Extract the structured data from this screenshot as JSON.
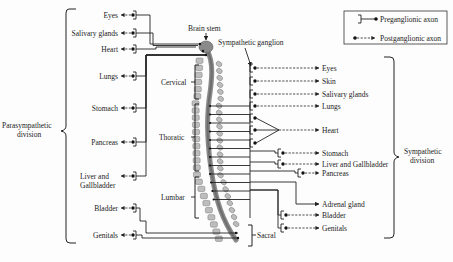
{
  "legend": {
    "preganglionic": "Preganglionic axon",
    "postganglionic": "Postganglionic axon"
  },
  "center": {
    "brain_stem": "Brain stem",
    "sympathetic_ganglion": "Sympathetic ganglion",
    "regions": [
      "Cervical",
      "Thoratic",
      "Lumbar",
      "Sacral"
    ]
  },
  "parasympathetic": {
    "title_line1": "Parasympathetic",
    "title_line2": "division",
    "targets": [
      "Eyes",
      "Salivary glands",
      "Heart",
      "Lungs",
      "Stomach",
      "Pancreas",
      "Liver and",
      "Gallbladder",
      "Bladder",
      "Genitals"
    ]
  },
  "sympathetic": {
    "title_line1": "Sympathetic",
    "title_line2": "division",
    "targets": [
      "Eyes",
      "Skin",
      "Salivary glands",
      "Lungs",
      "Heart",
      "Stomach",
      "Liver and Gallbladder",
      "Pancreas",
      "Adrenal gland",
      "Bladder",
      "Genitals"
    ]
  }
}
